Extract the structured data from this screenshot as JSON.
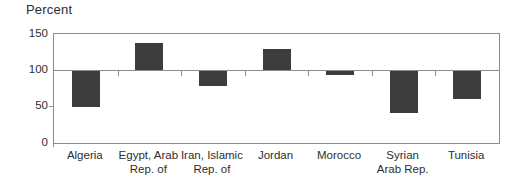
{
  "chart_data": {
    "type": "bar",
    "title": "",
    "ylabel": "Percent",
    "xlabel": "",
    "categories": [
      "Algeria",
      "Egypt, Arab\nRep. of",
      "Iran, Islamic\nRep. of",
      "Jordan",
      "Morocco",
      "Syrian\nArab Rep.",
      "Tunisia"
    ],
    "values": [
      50,
      138,
      79,
      130,
      94,
      41,
      61
    ],
    "baseline": 100,
    "ylim": [
      0,
      150
    ],
    "yticks": [
      0,
      50,
      100,
      150
    ],
    "grid": false,
    "legend": "none",
    "bar_color": "#3d3d3d",
    "axis_color": "#8c8c8c",
    "text_color": "#2e2e2e",
    "background_color": "#ffffff"
  }
}
